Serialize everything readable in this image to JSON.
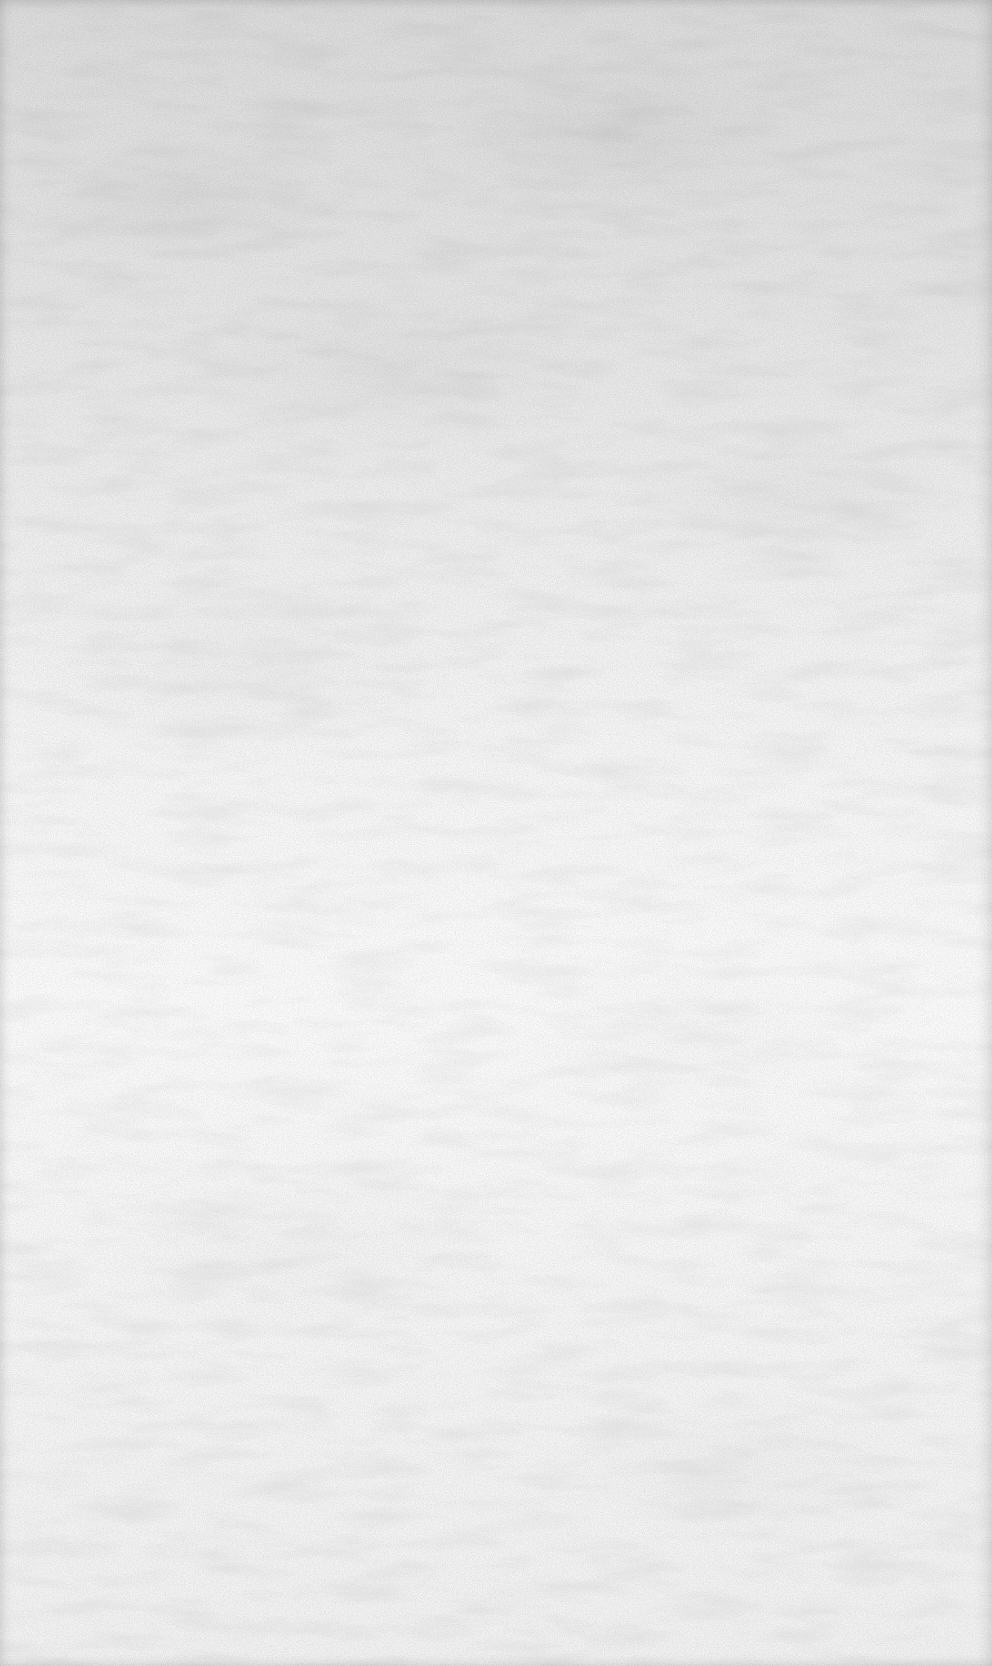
{
  "page": {
    "kind": "blank-paper-sheet",
    "visible_text": [],
    "colors": {
      "top_tone": "#dcdcdc",
      "mid_tone": "#f6f6f6",
      "bottom_tone": "#f2f2f2",
      "edge_shadow": "#c8c8c8",
      "grain": "#a8a8a8"
    }
  }
}
